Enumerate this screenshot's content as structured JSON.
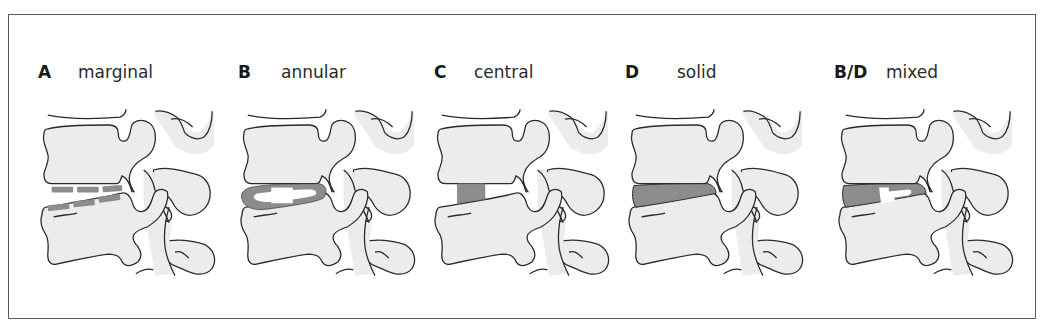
{
  "figure": {
    "colors": {
      "outline": "#2a2a2a",
      "bone_fill": "#ececec",
      "calcification_fill": "#8c8c8c",
      "frame_border": "#5a5a5a",
      "background": "#ffffff"
    },
    "panels": [
      {
        "id": "A",
        "letter": "A",
        "label": "marginal",
        "pattern": "marginal"
      },
      {
        "id": "B",
        "letter": "B",
        "label": "annular",
        "pattern": "annular"
      },
      {
        "id": "C",
        "letter": "C",
        "label": "central",
        "pattern": "central"
      },
      {
        "id": "D",
        "letter": "D",
        "label": "solid",
        "pattern": "solid"
      },
      {
        "id": "B/D",
        "letter": "B/D",
        "label": "mixed",
        "pattern": "mixed"
      }
    ]
  }
}
